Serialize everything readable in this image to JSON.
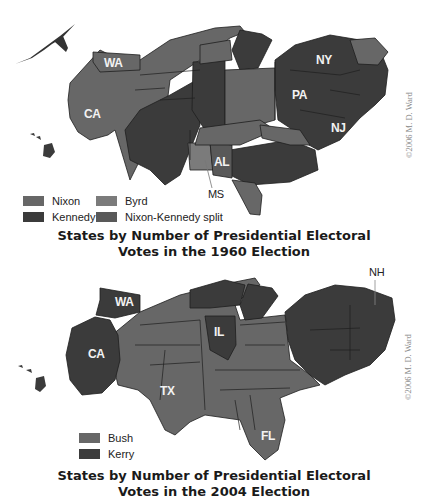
{
  "map1960": {
    "title_line1": "States by Number of Presidential Electoral",
    "title_line2": "Votes in the 1960 Election",
    "copyright": "©2006 M. D. Ward",
    "labels": {
      "WA": "WA",
      "CA": "CA",
      "NY": "NY",
      "PA": "PA",
      "NJ": "NJ",
      "AL": "AL",
      "MS": "MS"
    },
    "legend": [
      {
        "label": "Nixon",
        "color": "#676767"
      },
      {
        "label": "Byrd",
        "color": "#7b7b7b"
      },
      {
        "label": "Kennedy",
        "color": "#3b3b3b"
      },
      {
        "label": "Nixon-Kennedy split",
        "color": "#595959"
      }
    ]
  },
  "map2004": {
    "title_line1": "States by Number of Presidential Electoral",
    "title_line2": "Votes in the 2004 Election",
    "copyright": "©2006 M. D. Ward",
    "labels": {
      "WA": "WA",
      "CA": "CA",
      "IL": "IL",
      "TX": "TX",
      "FL": "FL",
      "NH": "NH"
    },
    "legend": [
      {
        "label": "Bush",
        "color": "#676767"
      },
      {
        "label": "Kerry",
        "color": "#3b3b3b"
      }
    ]
  },
  "colors": {
    "republican": "#676767",
    "democrat": "#3b3b3b",
    "byrd": "#7b7b7b",
    "split": "#595959",
    "border": "#1e1e1e"
  }
}
